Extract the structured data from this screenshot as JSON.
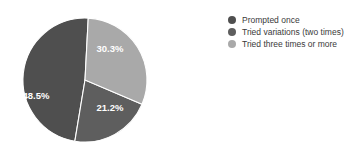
{
  "chart_data": {
    "type": "pie",
    "title": "",
    "subtitle": "",
    "xlabel": "",
    "ylabel": "",
    "grid": false,
    "legend_position": "right",
    "background_color": "#ffffff",
    "label_color": "#ffffff",
    "start_angle_deg": 0,
    "direction": "clockwise",
    "center": [
      85,
      80
    ],
    "radius": 62,
    "categories": [
      "Prompted once",
      "Tried variations (two times)",
      "Tried three times or more"
    ],
    "values": [
      48.5,
      21.2,
      30.3
    ],
    "value_labels": [
      "48.5%",
      "21.2%",
      "30.3%"
    ],
    "colors": [
      "#4f4f4f",
      "#5e5e5e",
      "#a9a9a9"
    ],
    "slices": [
      {
        "name": "Prompted once",
        "value": 48.5,
        "label": "48.5%",
        "color": "#4f4f4f",
        "start_deg": 189.4,
        "end_deg": 363.0,
        "label_x": 36,
        "label_y": 96
      },
      {
        "name": "Tried variations (two times)",
        "value": 21.2,
        "label": "21.2%",
        "color": "#5e5e5e",
        "start_deg": 113.1,
        "end_deg": 189.4,
        "label_x": 110,
        "label_y": 108
      },
      {
        "name": "Tried three times or more",
        "value": 30.3,
        "label": "30.3%",
        "color": "#a9a9a9",
        "start_deg": 3.0,
        "end_deg": 113.1,
        "label_x": 110,
        "label_y": 49
      }
    ]
  },
  "legend": {
    "items": [
      {
        "label": "Prompted once",
        "color": "#4f4f4f",
        "marker": "circle-marker"
      },
      {
        "label": "Tried variations (two times)",
        "color": "#5e5e5e",
        "marker": "circle-marker"
      },
      {
        "label": "Tried three times or more",
        "color": "#a9a9a9",
        "marker": "circle-marker"
      }
    ]
  }
}
